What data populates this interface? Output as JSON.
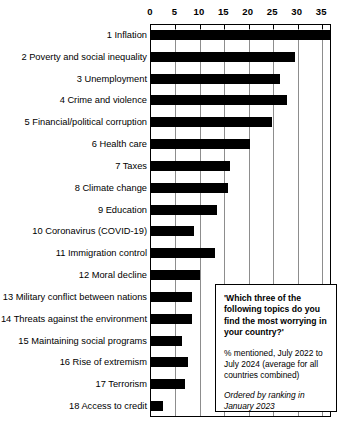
{
  "chart_data": {
    "type": "bar",
    "orientation": "horizontal",
    "title": "",
    "xlabel": "",
    "ylabel": "",
    "xlim": [
      0,
      37
    ],
    "xticks": [
      0,
      5,
      10,
      15,
      20,
      25,
      30,
      35
    ],
    "grid": true,
    "legend": "none",
    "bar_color": "#000000",
    "categories": [
      "1 Inflation",
      "2 Poverty and social inequality",
      "3 Unemployment",
      "4 Crime and violence",
      "5 Financial/political corruption",
      "6 Health care",
      "7 Taxes",
      "8 Climate change",
      "9 Education",
      "10 Coronavirus (COVID-19)",
      "11 Immigration control",
      "12 Moral decline",
      "13 Military conflict between nations",
      "14 Threats against the environment",
      "15 Maintaining social programs",
      "16 Rise of extremism",
      "17 Terrorism",
      "18 Access to credit"
    ],
    "values": [
      36.8,
      29.7,
      26.5,
      28.0,
      25.0,
      20.5,
      16.3,
      16.0,
      13.6,
      9.0,
      13.2,
      10.2,
      8.6,
      8.6,
      6.5,
      7.7,
      7.2,
      2.6
    ]
  },
  "annotation": {
    "question": "'Which three of the following topics do you find the most worrying in your country?'",
    "subtitle": "% mentioned, July 2022 to July 2024 (average for all countries combined)",
    "ordering": "Ordered by ranking in January 2023"
  }
}
